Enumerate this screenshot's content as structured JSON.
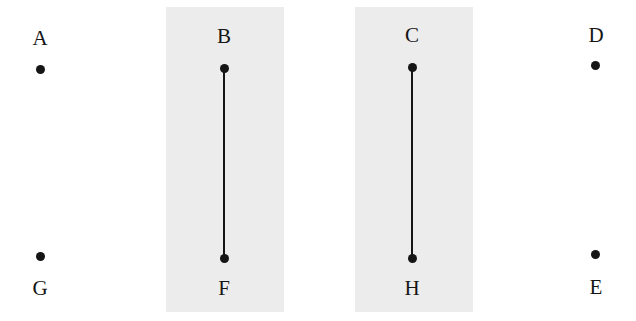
{
  "canvas": {
    "width": 636,
    "height": 321,
    "background_color": "#ffffff"
  },
  "panels": [
    {
      "id": "panel-left",
      "fill_color": "#ececec",
      "x": 166,
      "y": 7,
      "width": 118,
      "height": 305
    },
    {
      "id": "panel-right",
      "fill_color": "#ececec",
      "x": 355,
      "y": 7,
      "width": 118,
      "height": 305
    }
  ],
  "points": [
    {
      "id": "point-a",
      "label": "A",
      "x": 40,
      "y": 69,
      "label_x": 40,
      "label_y": 28,
      "label_position": "above",
      "on_panel": false,
      "dot_color": "#151515"
    },
    {
      "id": "point-b",
      "label": "B",
      "x": 224,
      "y": 68,
      "label_x": 224,
      "label_y": 26,
      "label_position": "above",
      "on_panel": true,
      "dot_color": "#151515"
    },
    {
      "id": "point-c",
      "label": "C",
      "x": 412,
      "y": 67,
      "label_x": 412,
      "label_y": 25,
      "label_position": "above",
      "on_panel": true,
      "dot_color": "#151515"
    },
    {
      "id": "point-d",
      "label": "D",
      "x": 595,
      "y": 65,
      "label_x": 596,
      "label_y": 25,
      "label_position": "above",
      "on_panel": false,
      "dot_color": "#151515"
    },
    {
      "id": "point-g",
      "label": "G",
      "x": 40,
      "y": 256,
      "label_x": 40,
      "label_y": 278,
      "label_position": "below",
      "on_panel": false,
      "dot_color": "#151515"
    },
    {
      "id": "point-f",
      "label": "F",
      "x": 224,
      "y": 258,
      "label_x": 224,
      "label_y": 278,
      "label_position": "below",
      "on_panel": true,
      "dot_color": "#151515"
    },
    {
      "id": "point-h",
      "label": "H",
      "x": 412,
      "y": 258,
      "label_x": 412,
      "label_y": 278,
      "label_position": "below",
      "on_panel": true,
      "dot_color": "#151515"
    },
    {
      "id": "point-e",
      "label": "E",
      "x": 595,
      "y": 254,
      "label_x": 596,
      "label_y": 277,
      "label_position": "below",
      "on_panel": false,
      "dot_color": "#151515"
    }
  ],
  "connectors": [
    {
      "id": "connector-b-f",
      "from": "B",
      "to": "F",
      "x": 224,
      "y_top": 68,
      "y_bottom": 258,
      "color": "#151515",
      "width": 2
    },
    {
      "id": "connector-c-h",
      "from": "C",
      "to": "H",
      "x": 412,
      "y_top": 67,
      "y_bottom": 258,
      "color": "#151515",
      "width": 2
    }
  ]
}
